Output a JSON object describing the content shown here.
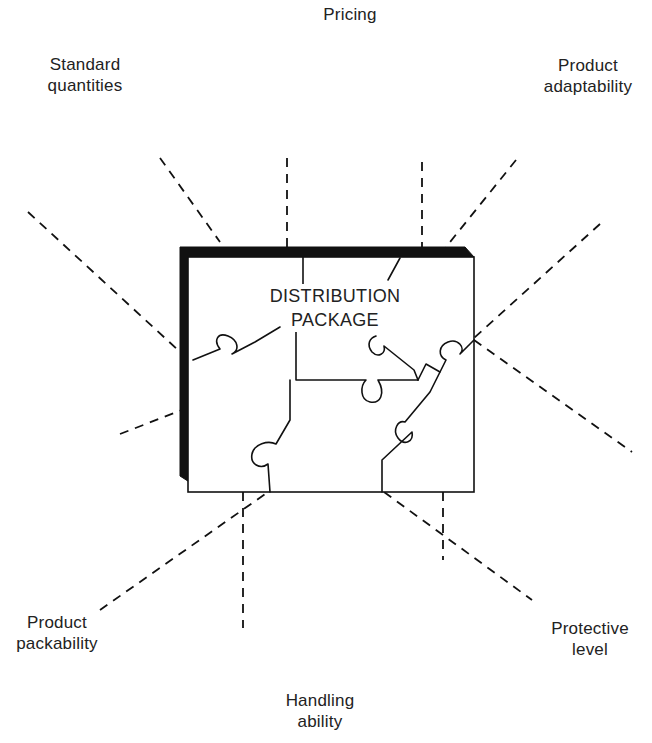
{
  "diagram": {
    "title": "DISTRIBUTION PACKAGE",
    "center": {
      "line1": "DISTRIBUTION",
      "line2": "PACKAGE"
    },
    "pieces": [
      {
        "id": "standard-quantities",
        "line1": "Standard",
        "line2": "quantities"
      },
      {
        "id": "pricing",
        "line1": "Pricing",
        "line2": ""
      },
      {
        "id": "product-adaptability",
        "line1": "Product",
        "line2": "adaptability"
      },
      {
        "id": "product-packability",
        "line1": "Product",
        "line2": "packability"
      },
      {
        "id": "handling-ability",
        "line1": "Handling",
        "line2": "ability"
      },
      {
        "id": "protective-level",
        "line1": "Protective",
        "line2": "level"
      }
    ],
    "colors": {
      "ink": "#111111",
      "background": "#ffffff"
    }
  }
}
